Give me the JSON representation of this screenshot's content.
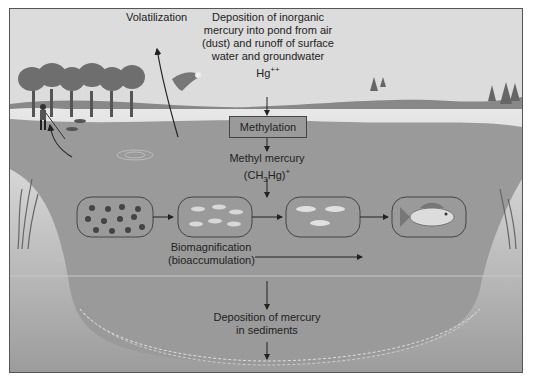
{
  "diagram": {
    "labels": {
      "volatilization": "Volatilization",
      "deposition_line1": "Deposition of inorganic",
      "deposition_line2": "mercury into pond from air",
      "deposition_line3": "(dust) and runoff of surface",
      "deposition_line4": "water and groundwater",
      "hg_ion": "Hg",
      "hg_charge": "++",
      "methylation": "Methylation",
      "methyl_mercury": "Methyl mercury",
      "methyl_formula_a": "(CH",
      "methyl_formula_sub": "3",
      "methyl_formula_b": "Hg)",
      "methyl_formula_charge": "+",
      "biomagnification": "Biomagnification",
      "bioaccumulation": "(bioaccumulation)",
      "sediment_line1": "Deposition of mercury",
      "sediment_line2": "in sediments"
    },
    "food_chain": [
      {
        "stage": "plankton",
        "icon": "plankton-icon"
      },
      {
        "stage": "small-organisms",
        "icon": "small-fish-icon"
      },
      {
        "stage": "small-fish",
        "icon": "small-fish-icon"
      },
      {
        "stage": "large-fish",
        "icon": "large-fish-icon"
      }
    ],
    "colors": {
      "sky": "#dcdcdc",
      "water": "#9a9a9a",
      "shore": "#e4e4e4",
      "trees": "#6e6e6e",
      "outline": "#444444"
    }
  }
}
